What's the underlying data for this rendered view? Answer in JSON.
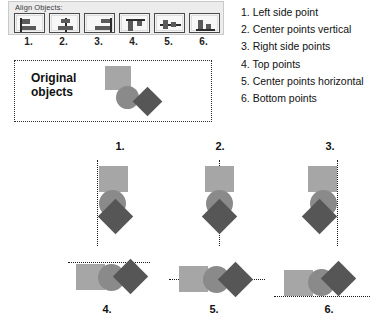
{
  "panel": {
    "title": "Align Objects:",
    "buttons": [
      {
        "number": "1.",
        "icon": "align-left-icon",
        "name": "align-left-button"
      },
      {
        "number": "2.",
        "icon": "align-center-vertical-icon",
        "name": "align-center-vertical-button"
      },
      {
        "number": "3.",
        "icon": "align-right-icon",
        "name": "align-right-button"
      },
      {
        "number": "4.",
        "icon": "align-top-icon",
        "name": "align-top-button"
      },
      {
        "number": "5.",
        "icon": "align-center-horizontal-icon",
        "name": "align-center-horizontal-button"
      },
      {
        "number": "6.",
        "icon": "align-bottom-icon",
        "name": "align-bottom-button"
      }
    ]
  },
  "legend": {
    "items": [
      "1. Left side point",
      "2. Center points vertical",
      "3. Right side points",
      "4. Top points",
      "5. Center points horizontal",
      "6. Bottom points"
    ]
  },
  "original": {
    "label_line1": "Original",
    "label_line2": "objects"
  },
  "examples": [
    {
      "number": "1.",
      "alignment": "left"
    },
    {
      "number": "2.",
      "alignment": "center-vertical"
    },
    {
      "number": "3.",
      "alignment": "right"
    },
    {
      "number": "4.",
      "alignment": "top"
    },
    {
      "number": "5.",
      "alignment": "center-horizontal"
    },
    {
      "number": "6.",
      "alignment": "bottom"
    }
  ],
  "colors": {
    "square": "#a6a6a6",
    "circle": "#8a8a8a",
    "diamond": "#565656",
    "guide_line": "#1a1a1a",
    "panel_bg": "#ececec"
  }
}
